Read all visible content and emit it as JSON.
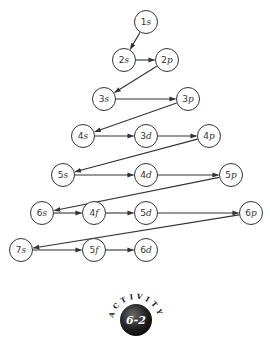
{
  "diagram": {
    "nodes": [
      {
        "id": "1s",
        "n": "1",
        "l": "s",
        "x": 146,
        "y": 22
      },
      {
        "id": "2s",
        "n": "2",
        "l": "s",
        "x": 124,
        "y": 60
      },
      {
        "id": "2p",
        "n": "2",
        "l": "p",
        "x": 167,
        "y": 60
      },
      {
        "id": "3s",
        "n": "3",
        "l": "s",
        "x": 104,
        "y": 99
      },
      {
        "id": "3p",
        "n": "3",
        "l": "p",
        "x": 188,
        "y": 99
      },
      {
        "id": "4s",
        "n": "4",
        "l": "s",
        "x": 83,
        "y": 136
      },
      {
        "id": "3d",
        "n": "3",
        "l": "d",
        "x": 146,
        "y": 136
      },
      {
        "id": "4p",
        "n": "4",
        "l": "p",
        "x": 209,
        "y": 136
      },
      {
        "id": "5s",
        "n": "5",
        "l": "s",
        "x": 63,
        "y": 175
      },
      {
        "id": "4d",
        "n": "4",
        "l": "d",
        "x": 146,
        "y": 175
      },
      {
        "id": "5p",
        "n": "5",
        "l": "p",
        "x": 231,
        "y": 175
      },
      {
        "id": "6s",
        "n": "6",
        "l": "s",
        "x": 42,
        "y": 213
      },
      {
        "id": "4f",
        "n": "4",
        "l": "f",
        "x": 94,
        "y": 213
      },
      {
        "id": "5d",
        "n": "5",
        "l": "d",
        "x": 146,
        "y": 213
      },
      {
        "id": "6p",
        "n": "6",
        "l": "p",
        "x": 251,
        "y": 213
      },
      {
        "id": "7s",
        "n": "7",
        "l": "s",
        "x": 21,
        "y": 250
      },
      {
        "id": "5f",
        "n": "5",
        "l": "f",
        "x": 94,
        "y": 250
      },
      {
        "id": "6d",
        "n": "6",
        "l": "d",
        "x": 146,
        "y": 250
      }
    ],
    "edges": [
      [
        "1s",
        "2s"
      ],
      [
        "2s",
        "2p"
      ],
      [
        "2p",
        "3s"
      ],
      [
        "3s",
        "3p"
      ],
      [
        "3p",
        "4s"
      ],
      [
        "4s",
        "3d"
      ],
      [
        "3d",
        "4p"
      ],
      [
        "4p",
        "5s"
      ],
      [
        "5s",
        "4d"
      ],
      [
        "4d",
        "5p"
      ],
      [
        "5p",
        "6s"
      ],
      [
        "6s",
        "4f"
      ],
      [
        "4f",
        "5d"
      ],
      [
        "5d",
        "6p"
      ],
      [
        "6p",
        "7s"
      ],
      [
        "7s",
        "5f"
      ],
      [
        "5f",
        "6d"
      ]
    ],
    "colors": {
      "stroke": "#333333",
      "badge": "#1a1a1a"
    }
  },
  "badge": {
    "arc_text": "ACTIVITY",
    "label": "6-2"
  }
}
